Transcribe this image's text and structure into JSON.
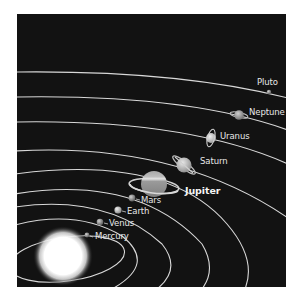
{
  "diagram": {
    "background_color": "#121212",
    "orbit_color": "#d8d8d8",
    "sun": {
      "name": "Sun",
      "color": "#ffffff"
    },
    "planets": [
      {
        "name": "Mercury",
        "label": "Mercury",
        "emphasis": false
      },
      {
        "name": "Venus",
        "label": "Venus",
        "emphasis": false
      },
      {
        "name": "Earth",
        "label": "Earth",
        "emphasis": false
      },
      {
        "name": "Mars",
        "label": "Mars",
        "emphasis": false
      },
      {
        "name": "Jupiter",
        "label": "Jupiter",
        "emphasis": true
      },
      {
        "name": "Saturn",
        "label": "Saturn",
        "emphasis": false
      },
      {
        "name": "Uranus",
        "label": "Uranus",
        "emphasis": false
      },
      {
        "name": "Neptune",
        "label": "Neptune",
        "emphasis": false
      },
      {
        "name": "Pluto",
        "label": "Pluto",
        "emphasis": false
      }
    ]
  }
}
